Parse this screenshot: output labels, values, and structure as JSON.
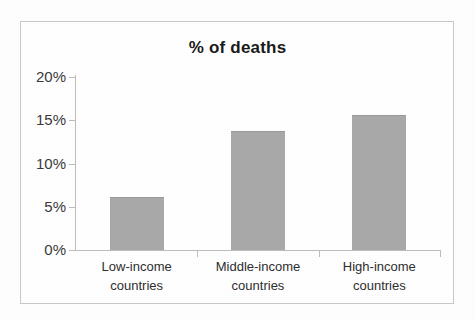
{
  "chart_data": {
    "type": "bar",
    "title": "% of deaths",
    "xlabel": "",
    "ylabel": "",
    "categories": [
      "Low-income countries",
      "Middle-income countries",
      "High-income countries"
    ],
    "category_lines": [
      [
        "Low-income",
        "countries"
      ],
      [
        "Middle-income",
        "countries"
      ],
      [
        "High-income",
        "countries"
      ]
    ],
    "values": [
      6.1,
      13.8,
      15.6
    ],
    "ylim": [
      0,
      20
    ],
    "y_ticks": [
      0,
      5,
      10,
      15,
      20
    ],
    "y_tick_labels": [
      "0%",
      "5%",
      "10%",
      "15%",
      "20%"
    ],
    "grid": false,
    "legend": false,
    "bar_color": "#a9a9a9",
    "axis_color": "#bdbdbd",
    "text_color": "#2e2e2e",
    "frame_color": "#c9c9c9",
    "background": "#ffffff"
  }
}
